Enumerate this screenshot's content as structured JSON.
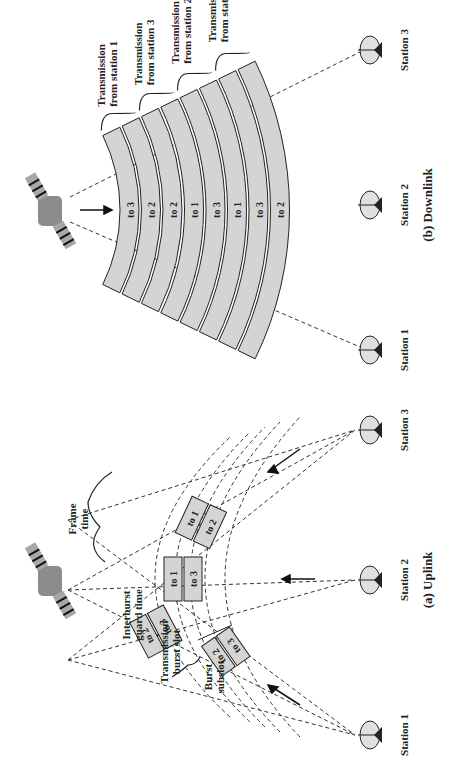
{
  "figure": {
    "orientation": "rotated-90-ccw",
    "colors": {
      "band_fill": "#d4d4d4",
      "line": "#222222",
      "satellite": "#8c8c8c",
      "background": "#ffffff"
    }
  },
  "uplink": {
    "caption": "(a) Uplink",
    "stations": [
      {
        "label": "Station 1"
      },
      {
        "label": "Station 2"
      },
      {
        "label": "Station 3"
      }
    ],
    "bursts": [
      {
        "station": "Station 1",
        "subslots": [
          "to 2",
          "to 3"
        ]
      },
      {
        "station": "Station 2",
        "subslots": [
          "to 1",
          "to 3"
        ]
      },
      {
        "station": "Station 3",
        "subslots": [
          "to 1",
          "to 2"
        ]
      },
      {
        "station": "Station 1",
        "subslots": [
          "to 2",
          "to 3"
        ]
      }
    ],
    "annotations": {
      "frame_time": [
        "Frame",
        "time"
      ],
      "interburst_guard_time": [
        "Interburst",
        "guard time"
      ],
      "transmission_burst_slot": [
        "Transmission",
        "burst slot"
      ],
      "burst_subslot": [
        "Burst",
        "subslot"
      ]
    }
  },
  "downlink": {
    "caption": "(b) Downlink",
    "stations": [
      {
        "label": "Station 1"
      },
      {
        "label": "Station 2"
      },
      {
        "label": "Station 3"
      }
    ],
    "bands": [
      "to 3",
      "to 2",
      "to 2",
      "to 1",
      "to 3",
      "to 1",
      "to 3",
      "to 2"
    ],
    "transmission_groups": [
      {
        "line1": "Transmission",
        "line2": "from station 1"
      },
      {
        "line1": "Transmission",
        "line2": "from station 3"
      },
      {
        "line1": "Transmission",
        "line2": "from station 2"
      },
      {
        "line1": "Transmission",
        "line2": "from station 1"
      }
    ]
  }
}
